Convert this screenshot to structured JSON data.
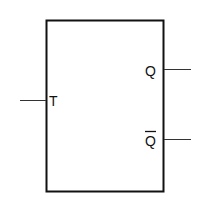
{
  "diagram": {
    "inputs": [
      {
        "label": "T"
      }
    ],
    "outputs": [
      {
        "label": "Q"
      },
      {
        "label": "Q",
        "overbar": true
      }
    ],
    "colors": {
      "stroke": "#111111",
      "background": "#ffffff"
    }
  }
}
